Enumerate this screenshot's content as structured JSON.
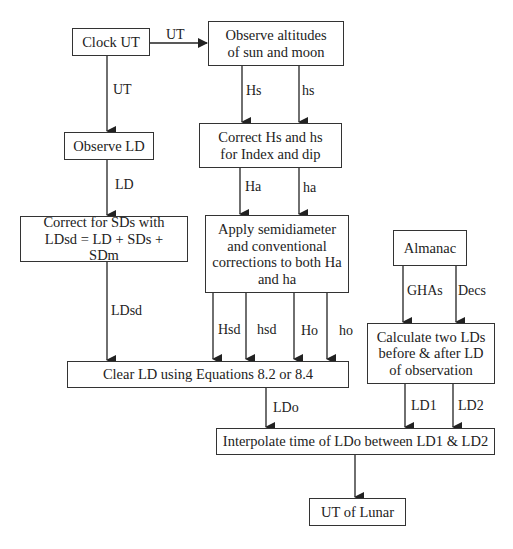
{
  "diagram": {
    "boxes": {
      "clock_ut": "Clock UT",
      "observe_alt": "Observe altitudes of sun and  moon",
      "observe_ld": "Observe LD",
      "correct_hs": "Correct Hs and hs for Index and dip",
      "correct_sd": "Correct for SDs with LDsd = LD + SDs + SDm",
      "apply_semi": "Apply semidiameter and conventional corrections to both Ha and ha",
      "almanac": "Almanac",
      "calc_lds": "Calculate two LDs before & after LD of observation",
      "clear_ld": "Clear LD using Equations 8.2 or 8.4",
      "interpolate": "Interpolate time of LDo between LD1 & LD2",
      "ut_lunar": "UT of Lunar"
    },
    "edge_labels": {
      "ut_right": "UT",
      "ut_down": "UT",
      "hs_upper": "Hs",
      "hs_lower": "hs",
      "ld": "LD",
      "ha_upper": "Ha",
      "ha_lower": "ha",
      "ldsd": "LDsd",
      "hsd_upper": "Hsd",
      "hsd_lower": "hsd",
      "ho_upper": "Ho",
      "ho_lower": "ho",
      "ghas": "GHAs",
      "decs": "Decs",
      "ldo": "LDo",
      "ld1": "LD1",
      "ld2": "LD2"
    },
    "line_color": "#222222"
  }
}
